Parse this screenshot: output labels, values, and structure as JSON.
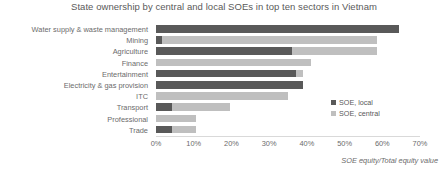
{
  "chart_data": {
    "type": "bar",
    "orientation": "horizontal",
    "stacked": true,
    "title": "State ownership by central and local SOEs in top ten sectors in Vietnam",
    "xlabel": "SOE equity/Total equity value",
    "ylabel": "",
    "xlim": [
      0,
      70
    ],
    "xticks": [
      "0%",
      "10%",
      "20%",
      "30%",
      "40%",
      "50%",
      "60%",
      "70%"
    ],
    "xtick_values": [
      0,
      10,
      20,
      30,
      40,
      50,
      60,
      70
    ],
    "grid": false,
    "legend_position": "inside-right",
    "categories": [
      "Water supply & waste management",
      "Mining",
      "Agriculture",
      "Finance",
      "Entertainment",
      "Electricity & gas provision",
      "ITC",
      "Transport",
      "Professional",
      "Trade"
    ],
    "series": [
      {
        "name": "SOE, local",
        "color": "#595959",
        "values": [
          64.5,
          1.5,
          36.0,
          0.0,
          37.0,
          39.0,
          0.0,
          4.2,
          0.0,
          4.2
        ]
      },
      {
        "name": "SOE, central",
        "color": "#bfbfbf",
        "values": [
          0.0,
          57.0,
          22.5,
          41.0,
          2.0,
          0.0,
          35.0,
          15.5,
          10.6,
          6.4
        ]
      }
    ],
    "totals": [
      64.5,
      58.5,
      58.5,
      41.0,
      39.0,
      39.0,
      35.0,
      19.7,
      10.6,
      10.6
    ]
  },
  "legend": {
    "items": [
      {
        "label": "SOE, local",
        "swatch": "legend-swatch-local"
      },
      {
        "label": "SOE, central",
        "swatch": "legend-swatch-central"
      }
    ]
  },
  "colors": {
    "local": "#595959",
    "central": "#bfbfbf",
    "text": "#6b6b6b",
    "background": "#ffffff"
  }
}
